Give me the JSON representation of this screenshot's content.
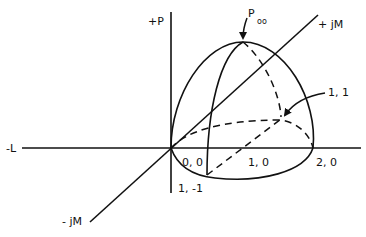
{
  "diagram": {
    "axes": {
      "plus_p": "+P",
      "minus_l": "-L",
      "plus_jm": "+ jM",
      "minus_jm": "- jM"
    },
    "points": {
      "peak_main": "P",
      "peak_sub": "oo",
      "origin": "0, 0",
      "one_zero": "1, 0",
      "two_zero": "2, 0",
      "one_minus_one": "1, -1",
      "one_one": "1, 1"
    },
    "colors": {
      "stroke": "#111111",
      "background": "#ffffff"
    }
  }
}
